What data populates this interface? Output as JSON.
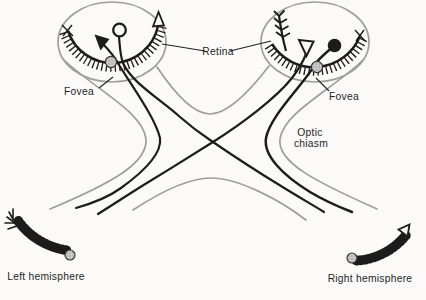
{
  "diagram": {
    "labels": {
      "retina": "Retina",
      "fovea_left": "Fovea",
      "fovea_right": "Fovea",
      "optic_chiasm_line1": "Optic",
      "optic_chiasm_line2": "chiasm",
      "left_hemisphere": "Left hemisphere",
      "right_hemisphere": "Right hemisphere"
    },
    "colors": {
      "background": "#fbfaf8",
      "outline_gray": "#9e9e9e",
      "line_black": "#1c1c1c",
      "stipple_fill": "#cccccc",
      "stipple_dot": "#8a8a8a",
      "text": "#1f1f1f"
    },
    "symbols": [
      {
        "name": "filled-triangle-stimulus",
        "eye": "left"
      },
      {
        "name": "open-circle-stimulus",
        "eye": "left"
      },
      {
        "name": "open-triangle-stimulus",
        "eye": "right"
      },
      {
        "name": "filled-circle-stimulus",
        "eye": "right"
      }
    ]
  }
}
